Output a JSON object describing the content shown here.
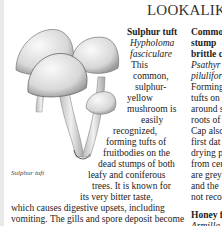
{
  "page": {
    "title": "LOOKALIKES"
  },
  "illustration": {
    "name": "sulphur-tuft-illustration",
    "caption": "Sulphur tuft"
  },
  "entries": [
    {
      "common_name": "Sulphur tuft",
      "latin_name": "Hypholoma fasciculare",
      "latin_line1": "Hypholoma",
      "latin_line2": "fasciculare",
      "body_lines": [
        "This",
        "common,",
        "sulphur-",
        "yellow",
        "mushroom is",
        "easily",
        "recognized,",
        "forming tufts of",
        "fruitbodies on the",
        "dead stumps of both",
        "leafy and coniferous",
        "trees. It is known for",
        "its very bitter taste,"
      ],
      "bottom_text": "which causes digestive upsets, including vomiting. The gills and spore deposit become blackish brown."
    },
    {
      "common_name_lines": [
        "Common",
        "stump",
        "brittle c"
      ],
      "latin_lines": [
        "Psathyr",
        "pilulifor"
      ],
      "body_lines": [
        "Forming",
        "tufts on",
        "around s",
        "roots of",
        "Cap also",
        "first dat",
        "drying p",
        "from cer",
        "are grey",
        "and the",
        "not reco"
      ]
    },
    {
      "common_name": "Honey f",
      "latin_name": "Armilla"
    }
  ]
}
